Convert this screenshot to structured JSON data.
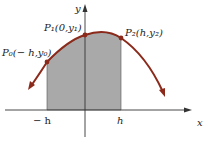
{
  "diagram": {
    "axes": {
      "x_label": "x",
      "y_label": "y"
    },
    "tick_labels": {
      "neg_h": "− h",
      "pos_h": "h"
    },
    "points": [
      {
        "id": "P0",
        "label": "P₀(− h,y₀)"
      },
      {
        "id": "P1",
        "label": "P₁(0,y₁)"
      },
      {
        "id": "P2",
        "label": "P₂(h,y₂)"
      }
    ],
    "colors": {
      "curve": "#8b2a1a",
      "shade": "#a9a9a9",
      "axis": "#333333",
      "point": "#8b2a1a"
    }
  }
}
